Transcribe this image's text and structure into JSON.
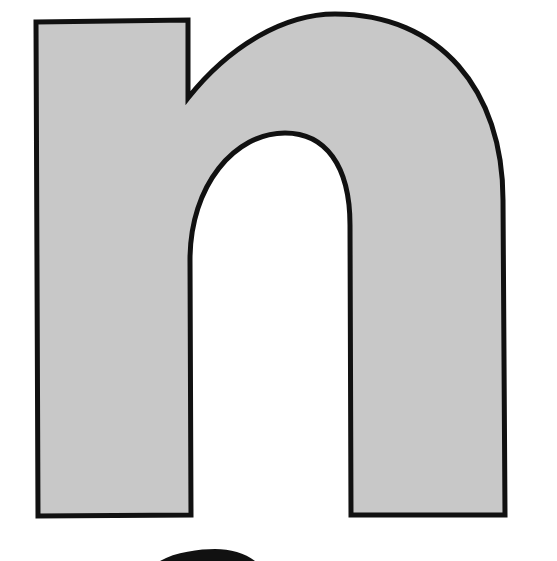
{
  "figure": {
    "glyph": "n",
    "fill_color": "#c8c8c8",
    "stroke_color": "#111111",
    "background_color": "#ffffff",
    "partial_shape_below": "top of a black rounded shape"
  }
}
